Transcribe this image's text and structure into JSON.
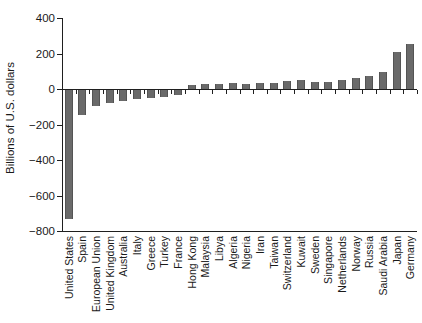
{
  "chart_data": {
    "type": "bar",
    "title": "",
    "xlabel": "",
    "ylabel": "Billions of U.S. dollars",
    "ylim": [
      -800,
      400
    ],
    "yticks": [
      400,
      200,
      0,
      -200,
      -400,
      -600,
      -800
    ],
    "grid": false,
    "legend": "none",
    "bar_color": "#6a6a6a",
    "axis_color": "#1f1f1f",
    "categories": [
      "United States",
      "Spain",
      "European Union",
      "United Kingdom",
      "Australia",
      "Italy",
      "Greece",
      "Turkey",
      "France",
      "Hong Kong",
      "Malaysia",
      "Libya",
      "Algeria",
      "Nigeria",
      "Iran",
      "Taiwan",
      "Switzerland",
      "Kuwait",
      "Sweden",
      "Singapore",
      "Netherlands",
      "Norway",
      "Russia",
      "Saudi Arabia",
      "Japan",
      "Germany"
    ],
    "values": [
      -731,
      -145,
      -95,
      -80,
      -65,
      -58,
      -51,
      -46,
      -35,
      25,
      29,
      29,
      31,
      28,
      34,
      33,
      43,
      48,
      40,
      42,
      52,
      60,
      76,
      95,
      211,
      253
    ]
  }
}
